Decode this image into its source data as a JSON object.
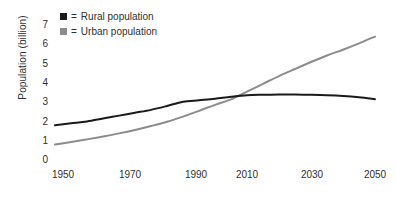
{
  "chart_data": {
    "type": "line",
    "title": "",
    "subtitle": "",
    "xlabel": "",
    "ylabel": "Population (billion)",
    "xlim": [
      1950,
      2050
    ],
    "ylim": [
      0,
      7
    ],
    "grid": false,
    "legend_position": "top-left",
    "x_ticks": [
      "1950",
      "1970",
      "1990",
      "2010",
      "2030",
      "2050"
    ],
    "y_ticks": [
      "0",
      "1",
      "2",
      "3",
      "4",
      "5",
      "6",
      "7"
    ],
    "x": [
      1950,
      1955,
      1960,
      1965,
      1970,
      1975,
      1980,
      1985,
      1990,
      1995,
      2000,
      2005,
      2010,
      2015,
      2020,
      2025,
      2030,
      2035,
      2040,
      2045,
      2050
    ],
    "series": [
      {
        "name": "Rural population",
        "color": "#1a1a1a",
        "legend_prefix": "=",
        "swatch": "black-square",
        "values": [
          1.8,
          1.9,
          2.0,
          2.15,
          2.3,
          2.45,
          2.6,
          2.8,
          3.02,
          3.1,
          3.18,
          3.28,
          3.36,
          3.38,
          3.39,
          3.39,
          3.38,
          3.36,
          3.32,
          3.25,
          3.15
        ]
      },
      {
        "name": "Urban population",
        "color": "#8c8c8c",
        "legend_prefix": "=",
        "swatch": "gray-square",
        "values": [
          0.8,
          0.93,
          1.07,
          1.22,
          1.38,
          1.56,
          1.76,
          1.98,
          2.25,
          2.55,
          2.86,
          3.14,
          3.55,
          3.95,
          4.35,
          4.72,
          5.08,
          5.42,
          5.72,
          6.05,
          6.4
        ]
      }
    ],
    "annotations": [
      {
        "text": "crossover",
        "x": 2008,
        "y": 3.35,
        "visible": false
      }
    ]
  },
  "colors": {
    "rural": "#1a1a1a",
    "urban": "#8c8c8c",
    "text": "#2f2f2f",
    "background": "#ffffff"
  },
  "legend": {
    "items": [
      {
        "equals": "=",
        "label": "Rural population"
      },
      {
        "equals": "=",
        "label": "Urban population"
      }
    ]
  }
}
